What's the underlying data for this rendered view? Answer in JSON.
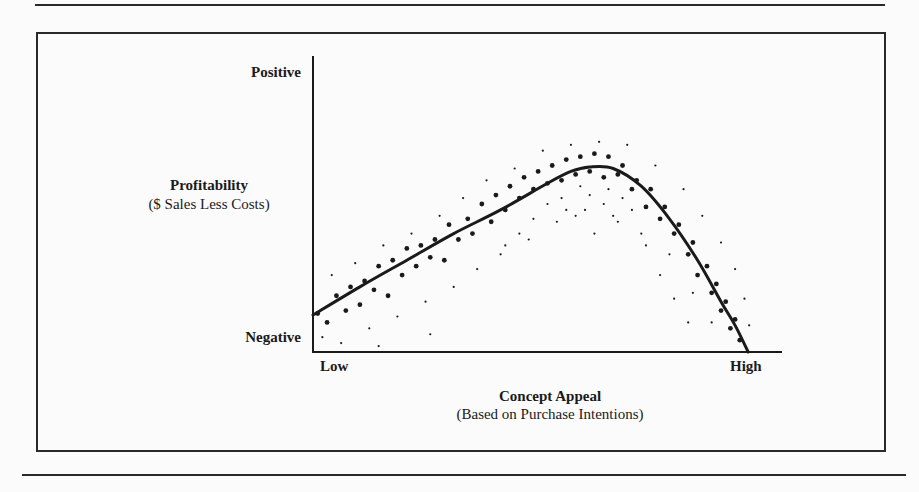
{
  "chart_data": {
    "type": "scatter",
    "title": "",
    "xlabel": "Concept Appeal",
    "xlabel_sub": "(Based on Purchase Intentions)",
    "ylabel": "Profitability",
    "ylabel_sub": "($ Sales Less Costs)",
    "x_ticks": {
      "low": "Low",
      "high": "High"
    },
    "y_ticks": {
      "low": "Negative",
      "high": "Positive"
    },
    "xlim": [
      0,
      1
    ],
    "ylim": [
      0,
      1
    ],
    "grid": false,
    "legend": null,
    "trend_line": {
      "shape": "inverted-U (rises roughly linearly, peaks at high appeal, then drops sharply)",
      "points": [
        [
          0.0,
          0.125
        ],
        [
          0.1,
          0.22
        ],
        [
          0.2,
          0.31
        ],
        [
          0.3,
          0.4
        ],
        [
          0.4,
          0.48
        ],
        [
          0.5,
          0.57
        ],
        [
          0.55,
          0.61
        ],
        [
          0.59,
          0.625
        ],
        [
          0.64,
          0.62
        ],
        [
          0.7,
          0.56
        ],
        [
          0.76,
          0.45
        ],
        [
          0.82,
          0.31
        ],
        [
          0.87,
          0.17
        ],
        [
          0.9,
          0.09
        ],
        [
          0.928,
          0.0
        ]
      ]
    },
    "scatter_points_large": [
      [
        0.01,
        0.13
      ],
      [
        0.03,
        0.1
      ],
      [
        0.05,
        0.19
      ],
      [
        0.07,
        0.14
      ],
      [
        0.08,
        0.22
      ],
      [
        0.1,
        0.16
      ],
      [
        0.11,
        0.24
      ],
      [
        0.13,
        0.21
      ],
      [
        0.14,
        0.29
      ],
      [
        0.16,
        0.19
      ],
      [
        0.17,
        0.31
      ],
      [
        0.19,
        0.26
      ],
      [
        0.2,
        0.35
      ],
      [
        0.22,
        0.29
      ],
      [
        0.23,
        0.36
      ],
      [
        0.25,
        0.32
      ],
      [
        0.26,
        0.38
      ],
      [
        0.28,
        0.31
      ],
      [
        0.29,
        0.43
      ],
      [
        0.31,
        0.38
      ],
      [
        0.33,
        0.45
      ],
      [
        0.34,
        0.4
      ],
      [
        0.36,
        0.5
      ],
      [
        0.38,
        0.44
      ],
      [
        0.39,
        0.53
      ],
      [
        0.41,
        0.48
      ],
      [
        0.42,
        0.56
      ],
      [
        0.44,
        0.52
      ],
      [
        0.45,
        0.59
      ],
      [
        0.47,
        0.55
      ],
      [
        0.48,
        0.61
      ],
      [
        0.5,
        0.57
      ],
      [
        0.51,
        0.63
      ],
      [
        0.53,
        0.58
      ],
      [
        0.54,
        0.65
      ],
      [
        0.56,
        0.6
      ],
      [
        0.57,
        0.66
      ],
      [
        0.59,
        0.61
      ],
      [
        0.6,
        0.67
      ],
      [
        0.62,
        0.59
      ],
      [
        0.63,
        0.66
      ],
      [
        0.65,
        0.6
      ],
      [
        0.66,
        0.63
      ],
      [
        0.68,
        0.55
      ],
      [
        0.69,
        0.58
      ],
      [
        0.71,
        0.49
      ],
      [
        0.72,
        0.55
      ],
      [
        0.74,
        0.45
      ],
      [
        0.75,
        0.49
      ],
      [
        0.77,
        0.4
      ],
      [
        0.78,
        0.43
      ],
      [
        0.8,
        0.33
      ],
      [
        0.81,
        0.37
      ],
      [
        0.82,
        0.26
      ],
      [
        0.84,
        0.29
      ],
      [
        0.85,
        0.2
      ],
      [
        0.86,
        0.23
      ],
      [
        0.87,
        0.14
      ],
      [
        0.88,
        0.17
      ],
      [
        0.89,
        0.08
      ],
      [
        0.9,
        0.11
      ],
      [
        0.91,
        0.04
      ]
    ],
    "scatter_points_small": [
      [
        0.02,
        0.05
      ],
      [
        0.04,
        0.26
      ],
      [
        0.06,
        0.03
      ],
      [
        0.09,
        0.3
      ],
      [
        0.12,
        0.08
      ],
      [
        0.15,
        0.36
      ],
      [
        0.18,
        0.12
      ],
      [
        0.21,
        0.4
      ],
      [
        0.24,
        0.17
      ],
      [
        0.27,
        0.46
      ],
      [
        0.3,
        0.22
      ],
      [
        0.32,
        0.52
      ],
      [
        0.35,
        0.28
      ],
      [
        0.37,
        0.58
      ],
      [
        0.4,
        0.33
      ],
      [
        0.43,
        0.62
      ],
      [
        0.46,
        0.38
      ],
      [
        0.49,
        0.68
      ],
      [
        0.52,
        0.44
      ],
      [
        0.55,
        0.7
      ],
      [
        0.58,
        0.48
      ],
      [
        0.61,
        0.71
      ],
      [
        0.64,
        0.46
      ],
      [
        0.67,
        0.7
      ],
      [
        0.7,
        0.4
      ],
      [
        0.73,
        0.63
      ],
      [
        0.76,
        0.33
      ],
      [
        0.79,
        0.55
      ],
      [
        0.81,
        0.2
      ],
      [
        0.83,
        0.46
      ],
      [
        0.85,
        0.1
      ],
      [
        0.87,
        0.37
      ],
      [
        0.9,
        0.28
      ],
      [
        0.92,
        0.18
      ],
      [
        0.93,
        0.09
      ],
      [
        0.47,
        0.45
      ],
      [
        0.5,
        0.5
      ],
      [
        0.53,
        0.52
      ],
      [
        0.56,
        0.46
      ],
      [
        0.59,
        0.53
      ],
      [
        0.62,
        0.5
      ],
      [
        0.65,
        0.44
      ],
      [
        0.68,
        0.48
      ],
      [
        0.71,
        0.36
      ],
      [
        0.74,
        0.26
      ],
      [
        0.77,
        0.18
      ],
      [
        0.8,
        0.1
      ],
      [
        0.44,
        0.4
      ],
      [
        0.41,
        0.36
      ],
      [
        0.6,
        0.4
      ],
      [
        0.63,
        0.55
      ],
      [
        0.57,
        0.56
      ],
      [
        0.66,
        0.52
      ],
      [
        0.54,
        0.48
      ],
      [
        0.14,
        0.02
      ],
      [
        0.25,
        0.06
      ]
    ]
  },
  "figure": {
    "colors": {
      "ink": "#1a1a1a",
      "paper": "#fbfbfb",
      "frame": "#2a2a2a"
    }
  }
}
